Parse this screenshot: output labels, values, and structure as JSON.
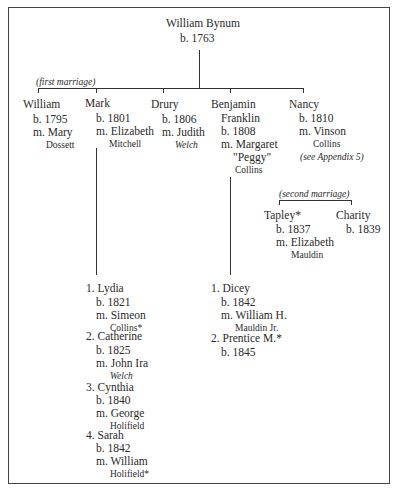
{
  "root": {
    "name": "William Bynum",
    "born": "b. 1763"
  },
  "first_marriage_label": "(first marriage)",
  "second_marriage_label": "(second marriage)",
  "children": [
    {
      "name": "William",
      "born": "b. 1795",
      "married": "m. Mary",
      "spouse_surname": "Dossett"
    },
    {
      "name": "Mark",
      "born": "b. 1801",
      "married": "m. Elizabeth",
      "spouse_surname": "Mitchell"
    },
    {
      "name": "Drury",
      "born": "b. 1806",
      "married": "m. Judith",
      "spouse_surname": "Welch"
    },
    {
      "name": "Benjamin",
      "name2": "Franklin",
      "born": "b. 1808",
      "married": "m. Margaret",
      "nickname": "\"Peggy\"",
      "spouse_surname": "Collins"
    },
    {
      "name": "Nancy",
      "born": "b. 1810",
      "married": "m. Vinson",
      "spouse_surname": "Collins",
      "note": "(see Appendix 5)"
    }
  ],
  "second_children": [
    {
      "name": "Tapley*",
      "born": "b. 1837",
      "married": "m. Elizabeth",
      "spouse_surname": "Mauldin"
    },
    {
      "name": "Charity",
      "born": "b. 1839"
    }
  ],
  "mark_children": [
    {
      "label": "1. Lydia",
      "born": "b. 1821",
      "married": "m. Simeon",
      "spouse_surname": "Collins*"
    },
    {
      "label": "2. Catherine",
      "born": "b. 1825",
      "married": "m. John Ira",
      "spouse_surname": "Welch"
    },
    {
      "label": "3. Cynthia",
      "born": "b. 1840",
      "married": "m. George",
      "spouse_surname": "Holifield"
    },
    {
      "label": "4. Sarah",
      "born": "b. 1842",
      "married": "m. William",
      "spouse_surname": "Holifield*"
    }
  ],
  "benjamin_children": [
    {
      "label": "1. Dicey",
      "born": "b. 1842",
      "married": "m. William H.",
      "spouse_surname": "Mauldin Jr."
    },
    {
      "label": "2. Prentice M.*",
      "born": "b. 1845"
    }
  ]
}
